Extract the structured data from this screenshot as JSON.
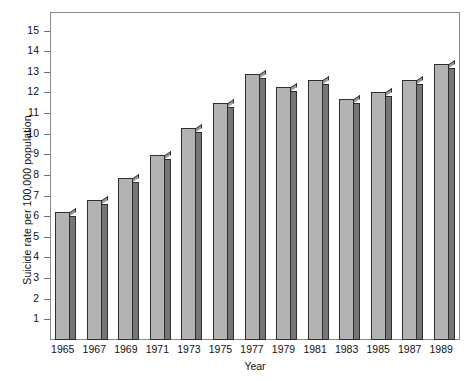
{
  "chart_data": {
    "type": "bar",
    "title": "",
    "xlabel": "Year",
    "ylabel": "Suicide rate per 100,000 population",
    "categories": [
      "1965",
      "1967",
      "1969",
      "1971",
      "1973",
      "1975",
      "1977",
      "1979",
      "1981",
      "1983",
      "1985",
      "1987",
      "1989"
    ],
    "values": [
      6.2,
      6.8,
      7.85,
      8.95,
      10.3,
      11.5,
      12.9,
      12.25,
      12.6,
      11.7,
      12.0,
      12.6,
      13.4
    ],
    "series": [
      {
        "name": "Suicide rate",
        "values": [
          6.2,
          6.8,
          7.85,
          8.95,
          10.3,
          11.5,
          12.9,
          12.25,
          12.6,
          11.7,
          12.0,
          12.6,
          13.4
        ]
      }
    ],
    "ylim": [
      0,
      15.9
    ],
    "yticks": [
      1,
      2,
      3,
      4,
      5,
      6,
      7,
      8,
      9,
      10,
      11,
      12,
      13,
      14,
      15
    ],
    "ytick_labels": [
      "1",
      "2",
      "3",
      "4",
      "5",
      "6",
      "7",
      "8",
      "9",
      "10",
      "11",
      "12",
      "13",
      "14",
      "15"
    ],
    "grid": false,
    "legend": false,
    "legend_position": "none",
    "bar_style": "3d-shaded",
    "colors": {
      "bar_front": "#b3b3b3",
      "bar_side": "#767676",
      "bar_top": "#9a9a9a",
      "bar_outline": "#2e2e2e",
      "frame": "#8a8a8a",
      "tick": "#6f6f6f",
      "text": "#111111",
      "background": "#ffffff"
    }
  }
}
